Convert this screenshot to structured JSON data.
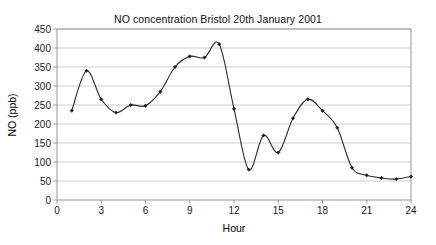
{
  "chart_data": {
    "type": "line",
    "title": "NO concentration Bristol 20th January 2001",
    "xlabel": "Hour",
    "ylabel": "NO (ppb)",
    "x": [
      1,
      2,
      3,
      4,
      5,
      6,
      7,
      8,
      9,
      10,
      11,
      12,
      13,
      14,
      15,
      16,
      17,
      18,
      19,
      20,
      21,
      22,
      23,
      24
    ],
    "values": [
      235,
      340,
      265,
      230,
      250,
      248,
      285,
      350,
      378,
      375,
      410,
      240,
      80,
      170,
      125,
      215,
      265,
      235,
      190,
      85,
      65,
      58,
      55,
      62
    ],
    "series": [
      {
        "name": "NO (ppb)",
        "values": [
          235,
          340,
          265,
          230,
          250,
          248,
          285,
          350,
          378,
          375,
          410,
          240,
          80,
          170,
          125,
          215,
          265,
          235,
          190,
          85,
          65,
          58,
          55,
          62
        ]
      }
    ],
    "xlim": [
      0,
      24
    ],
    "ylim": [
      0,
      450
    ],
    "xticks": [
      0,
      3,
      6,
      9,
      12,
      15,
      18,
      21,
      24
    ],
    "yticks": [
      0,
      50,
      100,
      150,
      200,
      250,
      300,
      350,
      400,
      450
    ],
    "xtick_labels": [
      "0",
      "3",
      "6",
      "9",
      "12",
      "15",
      "18",
      "21",
      "24"
    ],
    "ytick_labels": [
      "0",
      "50",
      "100",
      "150",
      "200",
      "250",
      "300",
      "350",
      "400",
      "450"
    ],
    "grid": "horizontal",
    "legend": "none",
    "marker": "diamond",
    "line_color": "#2b2b2b",
    "marker_color": "#1a1a1a",
    "grid_color": "#c9c9c9",
    "axis_color": "#8a8a8a",
    "smoothing": "spline"
  }
}
